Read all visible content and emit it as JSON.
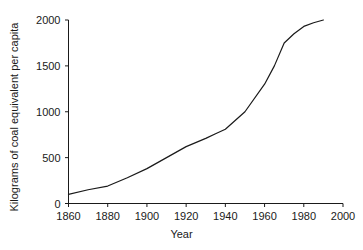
{
  "chart_data": {
    "type": "line",
    "title": "",
    "xlabel": "Year",
    "ylabel": "Kilograms of coal equivalent per capita",
    "xlim": [
      1860,
      2000
    ],
    "ylim": [
      0,
      2000
    ],
    "xticks": [
      1860,
      1880,
      1900,
      1920,
      1940,
      1960,
      1980,
      2000
    ],
    "xtick_labels": [
      "1860",
      "1880",
      "1900",
      "1920",
      "1940",
      "1960",
      "1980",
      "2000"
    ],
    "yticks": [
      0,
      500,
      1000,
      1500,
      2000
    ],
    "ytick_labels": [
      "0",
      "500",
      "1000",
      "1500",
      "2000"
    ],
    "grid": false,
    "legend": null,
    "series": [
      {
        "name": "World energy consumption per capita",
        "color": "#1a1a1a",
        "x": [
          1860,
          1870,
          1880,
          1890,
          1900,
          1910,
          1920,
          1930,
          1935,
          1940,
          1950,
          1960,
          1965,
          1970,
          1975,
          1980,
          1985,
          1990
        ],
        "values": [
          100,
          150,
          190,
          280,
          380,
          500,
          620,
          710,
          760,
          810,
          1000,
          1300,
          1500,
          1750,
          1850,
          1930,
          1970,
          2000
        ]
      }
    ]
  },
  "axis_titles": {
    "x": "Year",
    "y": "Kilograms of coal equivalent per capita"
  }
}
